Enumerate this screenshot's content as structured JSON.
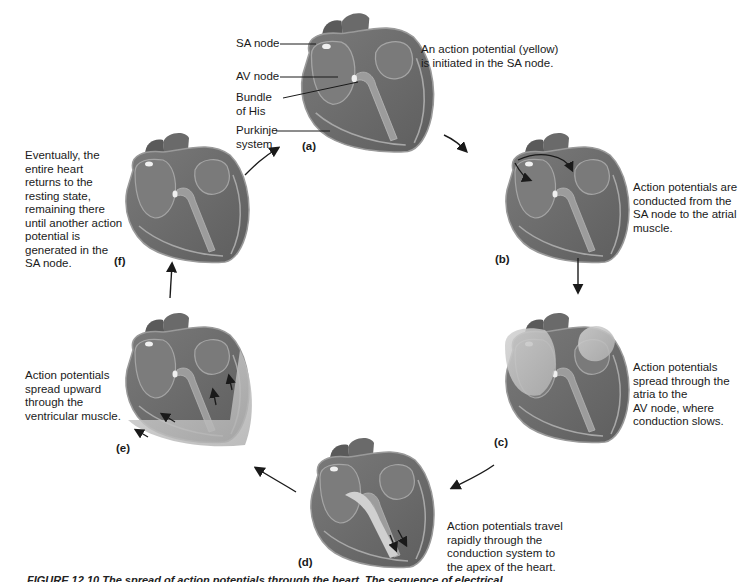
{
  "figure": {
    "caption": "FIGURE 12.10 The spread of action potentials through the heart. The sequence of electrical"
  },
  "structure_labels": {
    "sa_node": "SA node",
    "av_node": "AV node",
    "bundle_of_his": "Bundle\nof His",
    "purkinje_system": "Purkinje\nsystem"
  },
  "panels": [
    {
      "id": "a",
      "label": "(a)",
      "description": "An action potential (yellow)\nis initiated in the SA node."
    },
    {
      "id": "b",
      "label": "(b)",
      "description": "Action potentials are\nconducted from the\nSA node to the atrial\nmuscle."
    },
    {
      "id": "c",
      "label": "(c)",
      "description": "Action potentials\nspread through the\natria to the\nAV node, where\nconduction slows."
    },
    {
      "id": "d",
      "label": "(d)",
      "description": "Action potentials travel\nrapidly through the\nconduction system to\nthe apex of the heart."
    },
    {
      "id": "e",
      "label": "(e)",
      "description": "Action potentials\nspread upward\nthrough the\nventricular muscle."
    },
    {
      "id": "f",
      "label": "(f)",
      "description": "Eventually, the\nentire heart\nreturns to the\nresting state,\nremaining there\nuntil another action\npotential is\ngenerated in the\nSA node."
    }
  ],
  "colors": {
    "heart_dark": "#6e6e6e",
    "heart_mid": "#8a8a8a",
    "heart_light": "#c4c4c4",
    "conduction": "#bdbdbd",
    "arrow": "#1a1a1a"
  }
}
